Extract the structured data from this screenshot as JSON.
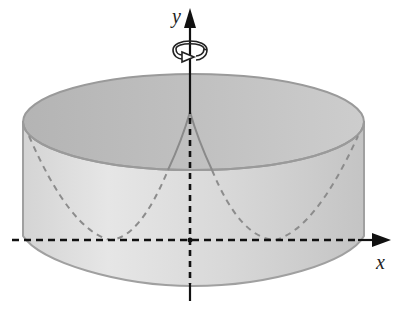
{
  "figure": {
    "axes": {
      "x_label": "x",
      "y_label": "y"
    },
    "rotation_axis": "y",
    "rotation_symbol": "circular-arrow-around-y-axis",
    "colors": {
      "cylinder_outer": "#e2e2e2",
      "cylinder_inner_top": "#bdbdbd",
      "cylinder_edge": "#9a9a9a",
      "curve_dashed": "#8c8c8c",
      "axis": "#111111"
    }
  }
}
